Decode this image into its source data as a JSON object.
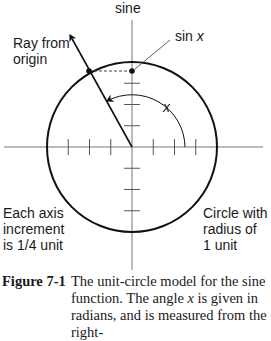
{
  "diagram": {
    "axis_label": "sine",
    "sin_label_prefix": "sin ",
    "sin_label_var": "x",
    "angle_label": "x",
    "ray_label_line1": "Ray from",
    "ray_label_line2": "origin",
    "increment_line1": "Each axis",
    "increment_line2": "increment",
    "increment_line3": "is 1/4 unit",
    "circle_line1": "Circle with",
    "circle_line2": "radius of",
    "circle_line3": "1 unit",
    "radius_units": 1,
    "tick_increment": 0.25
  },
  "caption": {
    "label": "Figure 7-1",
    "text_line1": "The unit-circle model for the sine",
    "text_line2_pre": "function. The angle ",
    "text_line2_var": "x",
    "text_line2_post": " is given in",
    "text_line3": "radians, and is measured from the right-"
  }
}
